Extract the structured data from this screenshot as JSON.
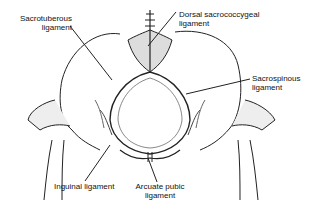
{
  "diagram": {
    "labels": {
      "sacrotuberous_line1": "Sacrotuberous",
      "sacrotuberous_line2": "ligament",
      "dorsal_line1": "Dorsal sacrococcygeal",
      "dorsal_line2": "ligament",
      "sacrospinous_line1": "Sacrospinous",
      "sacrospinous_line2": "ligament",
      "inguinal": "Inguinal ligament",
      "arcuate_line1": "Arcuate pubic",
      "arcuate_line2": "ligament"
    }
  }
}
